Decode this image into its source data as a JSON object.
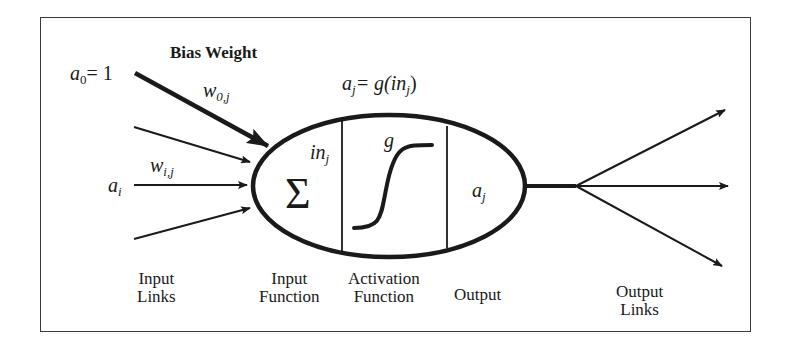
{
  "diagram": {
    "type": "artificial-neuron",
    "bias": {
      "title": "Bias Weight",
      "input_var": "a",
      "input_sub": "0",
      "input_eq": "= 1",
      "weight_var": "w",
      "weight_sub": "0,j"
    },
    "inputs": {
      "activation_var": "a",
      "activation_sub": "i",
      "weight_var": "w",
      "weight_sub": "i,j"
    },
    "neuron": {
      "equation_lhs_var": "a",
      "equation_lhs_sub": "j",
      "equation_mid": "= g(in",
      "equation_sub": "j",
      "equation_end": ")",
      "sum_symbol": "Σ",
      "in_var": "in",
      "in_sub": "j",
      "activation_fn": "g",
      "output_var": "a",
      "output_sub": "j"
    },
    "labels": {
      "input_links": [
        "Input",
        "Links"
      ],
      "input_function": [
        "Input",
        "Function"
      ],
      "activation_function": [
        "Activation",
        "Function"
      ],
      "output": "Output",
      "output_links": [
        "Output",
        "Links"
      ]
    },
    "colors": {
      "stroke": "#1a1a1a",
      "border": "#3a3a3a",
      "background": "#ffffff"
    }
  }
}
